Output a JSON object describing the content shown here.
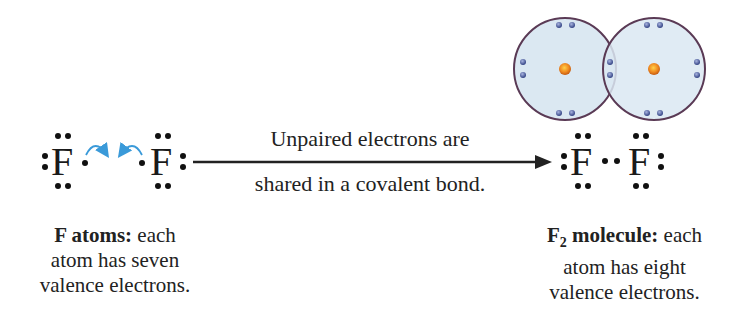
{
  "left": {
    "atom1_symbol": "F",
    "atom2_symbol": "F",
    "caption_bold": "F atoms:",
    "caption_line1_rest": " each",
    "caption_line2": "atom has seven",
    "caption_line3": "valence electrons."
  },
  "arrow": {
    "label_top": "Unpaired electrons are",
    "label_bottom": "shared in a covalent bond."
  },
  "right": {
    "atom1_symbol": "F",
    "atom2_symbol": "F",
    "caption_bold_main": "F",
    "caption_bold_sub": "2",
    "caption_bold_rest": " molecule:",
    "caption_line1_rest": " each",
    "caption_line2": "atom has eight",
    "caption_line3": "valence electrons."
  },
  "orbital_model": {
    "circle_fill": "#dbe8f2",
    "circle_stroke": "#5a3a55",
    "nucleus_color": "#e8781e",
    "electron_color": "#4a5a9a"
  },
  "colors": {
    "curved_arrow": "#3a9ad9",
    "text": "#222222"
  }
}
